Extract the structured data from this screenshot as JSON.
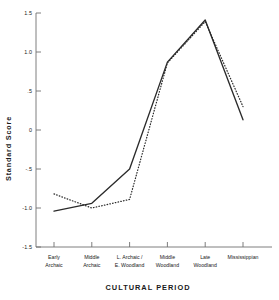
{
  "chart_data": {
    "type": "line",
    "title": "",
    "xlabel": "CULTURAL PERIOD",
    "ylabel": "Standard Score",
    "categories": [
      "Early Archaic",
      "Middle Archaic",
      "L. Archaic / E. Woodland",
      "Middle Woodland",
      "Late Woodland",
      "Mississippian"
    ],
    "category_lines": [
      [
        "Early",
        "Archaic"
      ],
      [
        "Middle",
        "Archaic"
      ],
      [
        "L. Archaic /",
        "E. Woodland"
      ],
      [
        "Middle",
        "Woodland"
      ],
      [
        "Late",
        "Woodland"
      ],
      [
        "Mississippian"
      ]
    ],
    "series": [
      {
        "name": "solid-series",
        "style": "solid",
        "color": "#2b2b2b",
        "values": [
          -1.04,
          -0.94,
          -0.5,
          0.87,
          1.41,
          0.13
        ]
      },
      {
        "name": "dotted-series",
        "style": "dotted",
        "color": "#2b2b2b",
        "values": [
          -0.82,
          -1.0,
          -0.89,
          0.86,
          1.39,
          0.3
        ]
      }
    ],
    "ylim": [
      -1.5,
      1.5
    ],
    "yticks": [
      1.5,
      1.0,
      0.5,
      0.0,
      -0.5,
      -1.0,
      -1.5
    ],
    "ytick_labels": [
      "1.5",
      "1.0",
      ".5",
      "0",
      "-.5",
      "-1.0",
      "-1.5"
    ],
    "grid": false,
    "legend": "none"
  }
}
